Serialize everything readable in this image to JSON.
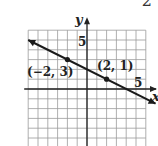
{
  "corner_mark": "2",
  "chart_data": {
    "type": "line",
    "title": "",
    "xlabel": "x",
    "ylabel": "y",
    "xlim": [
      -6,
      6
    ],
    "ylim": [
      -5,
      6
    ],
    "grid": true,
    "tick_labels": {
      "x": [
        "5"
      ],
      "y": [
        "5"
      ]
    },
    "series": [
      {
        "name": "line",
        "x": [
          -6,
          7
        ],
        "y": [
          5,
          -1.5
        ],
        "arrows": "both"
      }
    ],
    "points": [
      {
        "x": -2,
        "y": 3,
        "label": "(−2, 3)"
      },
      {
        "x": 2,
        "y": 1,
        "label": "(2, 1)"
      }
    ],
    "colors": {
      "grid": "#9a9a9a",
      "axis": "#222222",
      "line": "#1a1a1a"
    }
  }
}
